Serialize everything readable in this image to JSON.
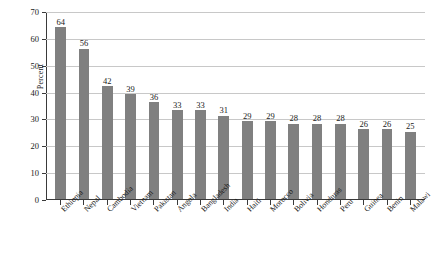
{
  "chart_data": {
    "type": "bar",
    "title": "",
    "xlabel": "",
    "ylabel": "Percent",
    "ylim": [
      0,
      70
    ],
    "yticks": [
      0,
      10,
      20,
      30,
      40,
      50,
      60,
      70
    ],
    "grid": true,
    "legend": false,
    "bar_color": "#808080",
    "categories": [
      "Ethiopia",
      "Nepal",
      "Cambodia",
      "Vietnam",
      "Pakistan",
      "Angola",
      "Bangladesh",
      "India",
      "Haiti",
      "Morocco",
      "Bolivia",
      "Honduras",
      "Peru",
      "Guinea",
      "Benin",
      "Malawi"
    ],
    "values": [
      64,
      56,
      42,
      39,
      36,
      33,
      33,
      31,
      29,
      29,
      28,
      28,
      28,
      26,
      26,
      25
    ],
    "data_labels": [
      "64",
      "56",
      "42",
      "39",
      "36",
      "33",
      "33",
      "31",
      "29",
      "29",
      "28",
      "28",
      "28",
      "26",
      "26",
      "25"
    ],
    "ytick_labels": [
      "0",
      "10",
      "20",
      "30",
      "40",
      "50",
      "60",
      "70"
    ]
  }
}
